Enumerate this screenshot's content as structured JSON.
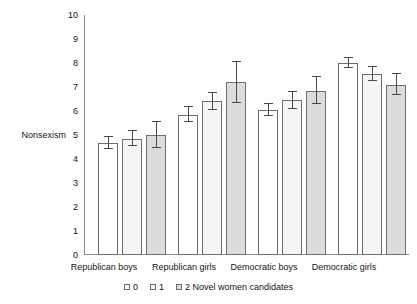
{
  "chart_data": {
    "type": "bar",
    "title": "",
    "xlabel": "",
    "ylabel": "Nonsexism",
    "ylim": [
      0,
      10
    ],
    "yticks": [
      0,
      1,
      2,
      3,
      4,
      5,
      6,
      7,
      8,
      9,
      10
    ],
    "ytick_labels": [
      "0",
      "1",
      "2",
      "3",
      "4",
      "5",
      "6",
      "7",
      "8",
      "9",
      "10"
    ],
    "grid": false,
    "legend_position": "bottom",
    "legend_title": "Novel women candidates",
    "categories": [
      "Republican boys",
      "Republican girls",
      "Democratic boys",
      "Democratic girls"
    ],
    "series": [
      {
        "name": "0",
        "values": [
          4.65,
          5.85,
          6.05,
          8.0
        ],
        "errors": [
          0.25,
          0.3,
          0.25,
          0.2
        ]
      },
      {
        "name": "1",
        "values": [
          4.85,
          6.4,
          6.45,
          7.55
        ],
        "errors": [
          0.3,
          0.35,
          0.35,
          0.3
        ]
      },
      {
        "name": "2 Novel women candidates",
        "values": [
          5.0,
          7.2,
          6.85,
          7.1
        ],
        "errors": [
          0.55,
          0.85,
          0.55,
          0.45
        ]
      }
    ],
    "colors": {
      "series0": "#ffffff",
      "series1": "#f5f5f5",
      "series2": "#dcdcdc",
      "bar_outline": "#6e6e6e",
      "axis": "#8a8a8a",
      "errorbar": "#4a4a4a",
      "text": "#141414",
      "background": "#ffffff"
    }
  },
  "legend": {
    "items": [
      {
        "label": "0"
      },
      {
        "label": "1"
      },
      {
        "label": "2 Novel women candidates"
      }
    ]
  }
}
